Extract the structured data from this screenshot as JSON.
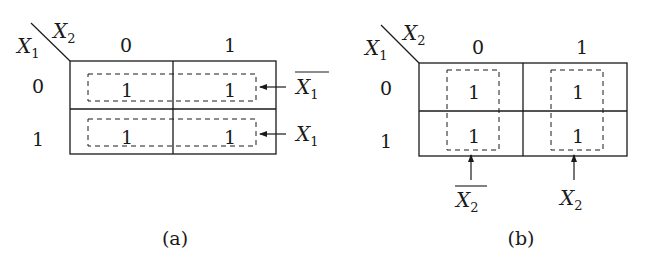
{
  "figure": {
    "panels": [
      {
        "id": "a",
        "caption": "(a)",
        "corner": {
          "row_var": "X",
          "row_sub": "1",
          "col_var": "X",
          "col_sub": "2"
        },
        "col_headers": [
          "0",
          "1"
        ],
        "row_headers": [
          "0",
          "1"
        ],
        "cells": [
          [
            "1",
            "1"
          ],
          [
            "1",
            "1"
          ]
        ],
        "groupings": [
          {
            "type": "row",
            "row": 0,
            "label_var": "X",
            "label_sub": "1",
            "complement": true
          },
          {
            "type": "row",
            "row": 1,
            "label_var": "X",
            "label_sub": "1",
            "complement": false
          }
        ]
      },
      {
        "id": "b",
        "caption": "(b)",
        "corner": {
          "row_var": "X",
          "row_sub": "1",
          "col_var": "X",
          "col_sub": "2"
        },
        "col_headers": [
          "0",
          "1"
        ],
        "row_headers": [
          "0",
          "1"
        ],
        "cells": [
          [
            "1",
            "1"
          ],
          [
            "1",
            "1"
          ]
        ],
        "groupings": [
          {
            "type": "column",
            "col": 0,
            "label_var": "X",
            "label_sub": "2",
            "complement": true
          },
          {
            "type": "column",
            "col": 1,
            "label_var": "X",
            "label_sub": "2",
            "complement": false
          }
        ]
      }
    ],
    "colors": {
      "ink": "#1a1a1a",
      "background": "#ffffff"
    }
  }
}
